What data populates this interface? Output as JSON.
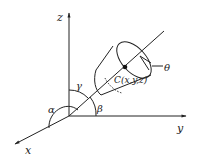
{
  "diagram": {
    "type": "3d-coordinate-orientation",
    "axes": {
      "x": "x",
      "y": "y",
      "z": "z"
    },
    "angles": {
      "alpha": "α",
      "beta": "β",
      "gamma": "γ",
      "theta": "θ"
    },
    "point": {
      "label": "C(x,y,z)"
    },
    "colors": {
      "stroke": "#222222",
      "background": "#ffffff"
    }
  }
}
